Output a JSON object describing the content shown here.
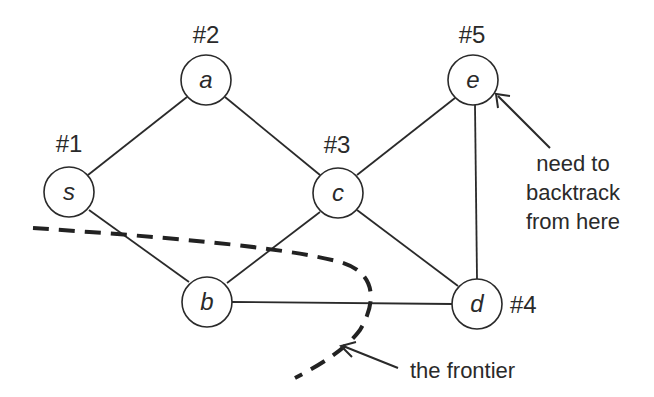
{
  "diagram": {
    "nodes": [
      {
        "id": "s",
        "label": "s",
        "order": "#1"
      },
      {
        "id": "a",
        "label": "a",
        "order": "#2"
      },
      {
        "id": "c",
        "label": "c",
        "order": "#3"
      },
      {
        "id": "d",
        "label": "d",
        "order": "#4"
      },
      {
        "id": "e",
        "label": "e",
        "order": "#5"
      },
      {
        "id": "b",
        "label": "b",
        "order": ""
      }
    ],
    "edges": [
      [
        "s",
        "a"
      ],
      [
        "s",
        "b"
      ],
      [
        "a",
        "c"
      ],
      [
        "c",
        "b"
      ],
      [
        "c",
        "e"
      ],
      [
        "c",
        "d"
      ],
      [
        "e",
        "d"
      ],
      [
        "b",
        "d"
      ]
    ],
    "annotations": {
      "backtrack": [
        "need to",
        "backtrack",
        "from here"
      ],
      "frontier": "the frontier"
    },
    "colors": {
      "stroke": "#2a2a2a",
      "background": "#ffffff"
    }
  }
}
